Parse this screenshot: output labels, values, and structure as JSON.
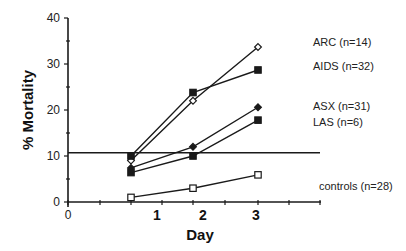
{
  "chart_data": {
    "type": "line",
    "title": "",
    "xlabel": "Day",
    "ylabel": "% Mortality",
    "x": [
      1,
      2,
      3
    ],
    "xlim": [
      0,
      4
    ],
    "ylim": [
      0,
      40
    ],
    "x_tick_labels": [
      "0",
      "1",
      "2",
      "3"
    ],
    "y_ticks": [
      0,
      10,
      20,
      30,
      40
    ],
    "y_tick_labels": [
      "0",
      "10",
      "20",
      "30",
      "40"
    ],
    "grid": false,
    "legend_position": "right, labels placed at line ends",
    "reference_line": {
      "orientation": "horizontal",
      "y": 10.7
    },
    "series": [
      {
        "name": "ARC (n=14)",
        "marker": "open-diamond",
        "values": [
          9.0,
          22.0,
          33.7
        ]
      },
      {
        "name": "AIDS (n=32)",
        "marker": "filled-square",
        "values": [
          10.0,
          23.8,
          28.7
        ]
      },
      {
        "name": "ASX (n=31)",
        "marker": "filled-diamond",
        "values": [
          7.4,
          12.0,
          20.6
        ]
      },
      {
        "name": "LAS (n=6)",
        "marker": "filled-square",
        "values": [
          6.4,
          10.0,
          17.8
        ]
      },
      {
        "name": "controls (n=28)",
        "marker": "open-square",
        "values": [
          1.0,
          3.0,
          5.9
        ]
      }
    ]
  },
  "labels": {
    "ylabel": "% Mortality",
    "xlabel": "Day",
    "legend": [
      "ARC (n=14)",
      "AIDS (n=32)",
      "ASX (n=31)",
      "LAS (n=6)",
      "controls (n=28)"
    ]
  }
}
